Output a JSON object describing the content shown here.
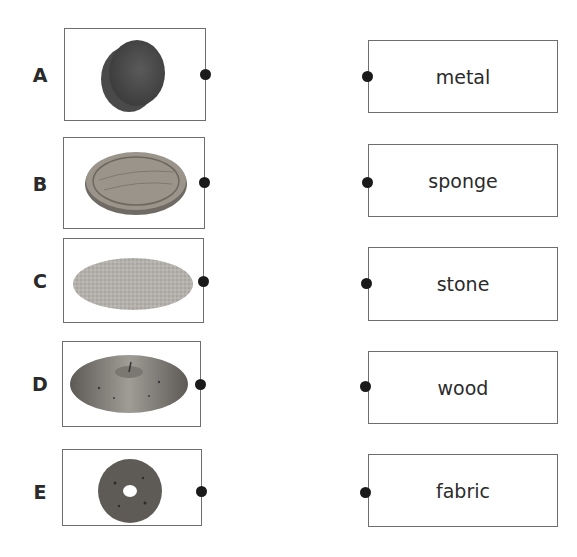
{
  "exercise": {
    "left_items": [
      {
        "letter": "A",
        "image": "sponge-icon",
        "description": "round grey sponge"
      },
      {
        "letter": "B",
        "image": "wooden-board-icon",
        "description": "round wooden board"
      },
      {
        "letter": "C",
        "image": "fabric-mat-icon",
        "description": "round fabric mat"
      },
      {
        "letter": "D",
        "image": "cymbal-icon",
        "description": "metal cymbal"
      },
      {
        "letter": "E",
        "image": "stone-ring-icon",
        "description": "stone ring with hole"
      }
    ],
    "right_items": [
      {
        "word": "metal"
      },
      {
        "word": "sponge"
      },
      {
        "word": "stone"
      },
      {
        "word": "wood"
      },
      {
        "word": "fabric"
      }
    ]
  }
}
